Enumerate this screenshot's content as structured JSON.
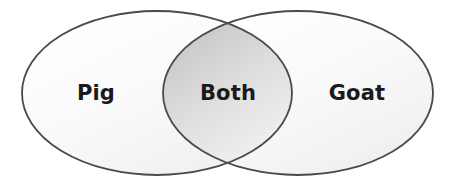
{
  "diagram": {
    "type": "venn-two-set",
    "title": "",
    "background_color": "#ffffff",
    "stroke_color": "#4a4a4a",
    "stroke_width": 1.8,
    "label_color": "#1a1a1a",
    "left_set": {
      "label": "Pig",
      "center_x": 157,
      "center_y": 93,
      "radius_x": 135,
      "radius_y": 82,
      "fill_start": "#ffffff",
      "fill_end": "#f2f2f2",
      "label_x": 96,
      "label_y": 93
    },
    "right_set": {
      "label": "Goat",
      "center_x": 298,
      "center_y": 93,
      "radius_x": 135,
      "radius_y": 82,
      "fill_start": "#ffffff",
      "fill_end": "#f2f2f2",
      "label_x": 357,
      "label_y": 93
    },
    "intersection": {
      "label": "Both",
      "label_x": 228,
      "label_y": 93,
      "top_point_x": 228,
      "top_point_y": 27,
      "bottom_point_x": 228,
      "bottom_point_y": 160,
      "fill_start": "#c9c9c9",
      "fill_end": "#fbfbfb"
    }
  }
}
